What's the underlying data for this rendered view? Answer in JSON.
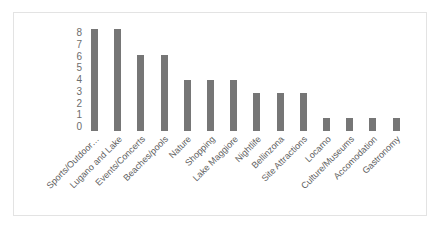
{
  "chart_data": {
    "type": "bar",
    "title": "",
    "xlabel": "",
    "ylabel": "",
    "ylim": [
      0,
      8
    ],
    "grid": false,
    "legend": "none",
    "bar_color": "#767676",
    "categories": [
      "Sports/Outdoor…",
      "Lugano and Lake",
      "Events/Concerts",
      "Beaches/pools",
      "Nature",
      "Shopping",
      "Lake Maggiore",
      "Nightlife",
      "Bellinzona",
      "Site Attractions",
      "Locarno",
      "Culture/Museums",
      "Accomodation",
      "Gastronomy"
    ],
    "values": [
      8,
      8,
      6,
      6,
      4,
      4,
      4,
      3,
      3,
      3,
      1,
      1,
      1,
      1
    ],
    "y_ticks": [
      "8",
      "7",
      "6",
      "5",
      "4",
      "3",
      "2",
      "1",
      "0"
    ]
  }
}
